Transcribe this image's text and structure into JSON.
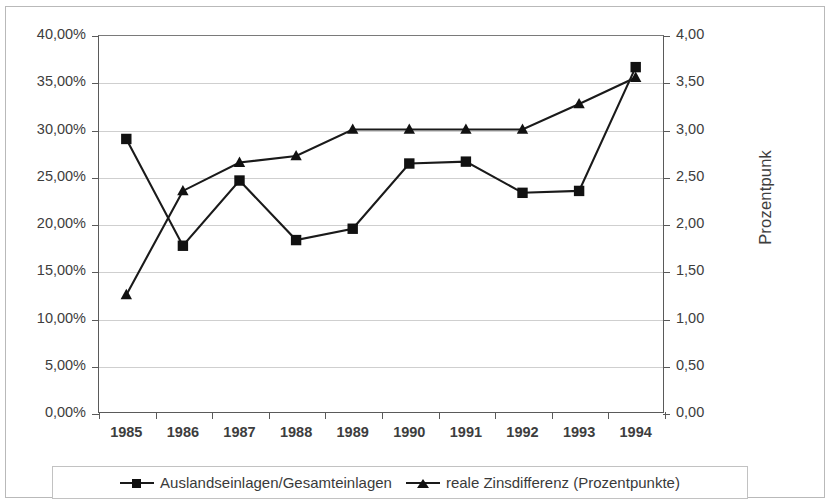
{
  "chart_data": {
    "type": "line",
    "title": "",
    "subtitle": "",
    "xlabel": "",
    "ylabel": "",
    "grid": true,
    "legend_position": "bottom",
    "categories": [
      "1985",
      "1986",
      "1987",
      "1988",
      "1989",
      "1990",
      "1991",
      "1992",
      "1993",
      "1994"
    ],
    "axes": {
      "left": {
        "label": "",
        "min": 0,
        "max": 40,
        "step": 5,
        "tick_labels": [
          "0,00%",
          "5,00%",
          "10,00%",
          "15,00%",
          "20,00%",
          "25,00%",
          "30,00%",
          "35,00%",
          "40,00%"
        ],
        "tick_values": [
          0,
          5,
          10,
          15,
          20,
          25,
          30,
          35,
          40
        ]
      },
      "right": {
        "label": "Prozentpunk",
        "min": 0,
        "max": 4,
        "step": 0.5,
        "tick_labels": [
          "0,00",
          "0,50",
          "1,00",
          "1,50",
          "2,00",
          "2,50",
          "3,00",
          "3,50",
          "4,00"
        ],
        "tick_values": [
          0,
          0.5,
          1,
          1.5,
          2,
          2.5,
          3,
          3.5,
          4
        ]
      }
    },
    "series": [
      {
        "name": "Auslandseinlagen/Gesamteinlagen",
        "axis": "left",
        "marker": "square",
        "color": "#111111",
        "values": [
          29.0,
          17.7,
          24.6,
          18.3,
          19.5,
          26.4,
          26.6,
          23.3,
          23.5,
          36.6
        ]
      },
      {
        "name": "reale Zinsdifferenz (Prozentpunkte)",
        "axis": "right",
        "marker": "triangle",
        "color": "#111111",
        "values": [
          1.25,
          2.35,
          2.65,
          2.72,
          3.0,
          3.0,
          3.0,
          3.0,
          3.27,
          3.55
        ]
      }
    ]
  },
  "legend": {
    "entries": [
      {
        "label": "Auslandseinlagen/Gesamteinlagen",
        "marker": "square-marker"
      },
      {
        "label": "reale Zinsdifferenz (Prozentpunkte)",
        "marker": "triangle-marker"
      }
    ]
  }
}
